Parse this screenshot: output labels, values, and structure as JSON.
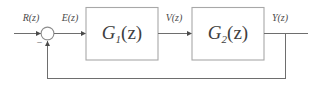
{
  "diagram": {
    "type": "control-system-block-diagram",
    "domain_note": "z-domain discrete-time closed-loop system",
    "input_signal": {
      "name": "input-signal-label",
      "text": "R(z)",
      "base": "R",
      "arg": "(z)"
    },
    "error_signal": {
      "name": "error-signal-label",
      "text": "E(z)",
      "base": "E",
      "arg": "(z)"
    },
    "intermediate_signal": {
      "name": "intermediate-signal-label",
      "text": "V(z)",
      "base": "V",
      "arg": "(z)"
    },
    "output_signal": {
      "name": "output-signal-label",
      "text": "Y(z)",
      "base": "Y",
      "arg": "(z)"
    },
    "summing_junction": {
      "name": "summing-junction",
      "negative_sign": "−",
      "feedback_sign": "negative",
      "positive_input": "R(z)",
      "negative_input": "Y(z)"
    },
    "blocks": [
      {
        "id": "block-g1",
        "base": "G",
        "subscript": "1",
        "arg": "(z)",
        "full_label": "G1(z)"
      },
      {
        "id": "block-g2",
        "base": "G",
        "subscript": "2",
        "arg": "(z)",
        "full_label": "G2(z)"
      }
    ],
    "feedback": {
      "name": "feedback-path",
      "kind": "unity-feedback",
      "label": ""
    },
    "colors": {
      "wire": "#6e6e6e",
      "block_border": "#a8a8a8",
      "text": "#3f3f3f",
      "background": "#ffffff"
    }
  }
}
